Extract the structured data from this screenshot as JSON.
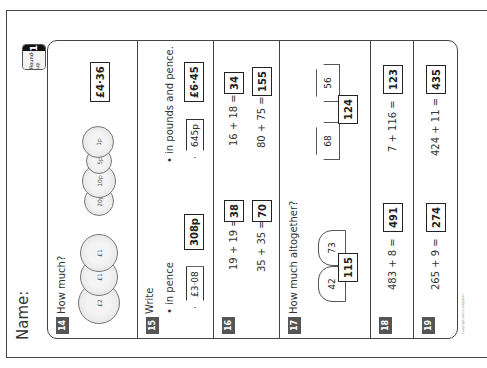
{
  "worksheet": {
    "name_label": "Name:",
    "badge": {
      "label": "Round-up",
      "number": "1"
    },
    "footer": "Copyright notice (illegible)"
  },
  "questions": [
    {
      "number": "14",
      "prompt": "How much?",
      "coins": [
        "£2",
        "£1",
        "£1",
        "20p",
        "10p",
        "5p",
        "1p"
      ],
      "answer": "£4·36"
    },
    {
      "number": "15",
      "prompt": "Write",
      "parts": [
        {
          "bullet": "• in pence",
          "given": "£3·08",
          "answer": "308p"
        },
        {
          "bullet": "• in pounds and pence.",
          "given": "645p",
          "answer": "£6·45"
        }
      ]
    },
    {
      "number": "16",
      "equations": [
        {
          "expr": "19 + 19 =",
          "answer": "38"
        },
        {
          "expr": "16 + 18 =",
          "answer": "34"
        },
        {
          "expr": "35 + 35 =",
          "answer": "70"
        },
        {
          "expr": "80 + 75 =",
          "answer": "155"
        }
      ]
    },
    {
      "number": "17",
      "prompt": "How much altogether?",
      "groups": [
        {
          "items": [
            "42",
            "73"
          ],
          "answer": "115"
        },
        {
          "items": [
            "68",
            "56"
          ],
          "answer": "124"
        }
      ]
    },
    {
      "number": "18",
      "equations": [
        {
          "expr": "483 + 8 =",
          "answer": "491"
        },
        {
          "expr": "7 + 116 =",
          "answer": "123"
        }
      ]
    },
    {
      "number": "19",
      "equations": [
        {
          "expr": "265 + 9 =",
          "answer": "274"
        },
        {
          "expr": "424 + 11 =",
          "answer": "435"
        }
      ]
    }
  ]
}
